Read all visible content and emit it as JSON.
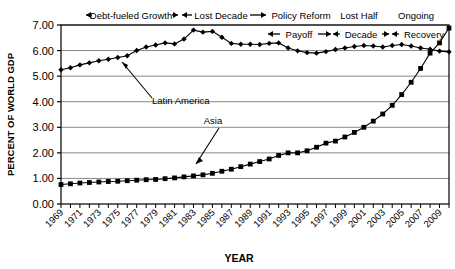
{
  "chart_data": {
    "type": "line",
    "title": "",
    "xlabel": "YEAR",
    "ylabel": "PERCENT OF WORLD GDP",
    "xlim": [
      1969,
      2010
    ],
    "ylim": [
      0.0,
      7.0
    ],
    "ytick_labels": [
      "7.00",
      "6.00",
      "5.00",
      "4.00",
      "3.00",
      "2.00",
      "1.00",
      "0.00"
    ],
    "ytick_values": [
      7,
      6,
      5,
      4,
      3,
      2,
      1,
      0
    ],
    "xtick_labels": [
      "1969",
      "1971",
      "1973",
      "1975",
      "1977",
      "1979",
      "1981",
      "1983",
      "1985",
      "1987",
      "1989",
      "1991",
      "1993",
      "1995",
      "1997",
      "1999",
      "2001",
      "2003",
      "2005",
      "2007",
      "2009"
    ],
    "grid": "horizontal",
    "legend_position": "inline-annotation",
    "x": [
      1969,
      1970,
      1971,
      1972,
      1973,
      1974,
      1975,
      1976,
      1977,
      1978,
      1979,
      1980,
      1981,
      1982,
      1983,
      1984,
      1985,
      1986,
      1987,
      1988,
      1989,
      1990,
      1991,
      1992,
      1993,
      1994,
      1995,
      1996,
      1997,
      1998,
      1999,
      2000,
      2001,
      2002,
      2003,
      2004,
      2005,
      2006,
      2007,
      2008,
      2009,
      2010
    ],
    "series": [
      {
        "name": "Latin America",
        "marker": "diamond",
        "values": [
          5.25,
          5.33,
          5.44,
          5.52,
          5.6,
          5.66,
          5.73,
          5.8,
          6.0,
          6.14,
          6.22,
          6.3,
          6.26,
          6.45,
          6.8,
          6.72,
          6.75,
          6.52,
          6.28,
          6.25,
          6.25,
          6.24,
          6.28,
          6.3,
          6.1,
          5.99,
          5.92,
          5.9,
          5.96,
          6.04,
          6.1,
          6.16,
          6.2,
          6.18,
          6.14,
          6.2,
          6.24,
          6.18,
          6.1,
          6.05,
          5.98,
          5.95
        ]
      },
      {
        "name": "Asia",
        "marker": "square",
        "values": [
          0.76,
          0.79,
          0.82,
          0.84,
          0.86,
          0.88,
          0.89,
          0.91,
          0.93,
          0.95,
          0.96,
          0.99,
          1.02,
          1.06,
          1.1,
          1.14,
          1.2,
          1.28,
          1.36,
          1.46,
          1.56,
          1.66,
          1.76,
          1.9,
          2.0,
          2.0,
          2.08,
          2.22,
          2.38,
          2.46,
          2.62,
          2.8,
          3.0,
          3.24,
          3.52,
          3.86,
          4.28,
          4.76,
          5.3,
          5.9,
          6.3,
          6.88
        ]
      }
    ],
    "annotations": [
      {
        "label": "Latin America",
        "target_series": "Latin America"
      },
      {
        "label": "Asia",
        "target_series": "Asia"
      }
    ],
    "era_bands_top": [
      {
        "label": "Debt-fueled Growth",
        "arrows": "both"
      },
      {
        "label": "Lost Decade",
        "arrows": "both"
      },
      {
        "label": "Policy Reform",
        "arrows": "none"
      },
      {
        "label": "Lost Half",
        "arrows": "none"
      },
      {
        "label": "Ongoing",
        "arrows": "none"
      }
    ],
    "era_bands_inner": [
      {
        "label": "Payoff",
        "arrows": "both"
      },
      {
        "label": "Decade",
        "arrows": "both"
      },
      {
        "label": "Recovery",
        "arrows": "left"
      }
    ]
  }
}
